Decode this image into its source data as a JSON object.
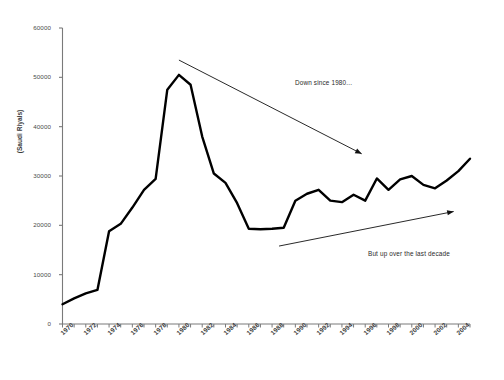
{
  "chart_data": {
    "type": "line",
    "title": "",
    "xlabel": "",
    "ylabel": "(Saudi Riyals)",
    "ylim": [
      0,
      60000
    ],
    "xlim": [
      1970,
      2005
    ],
    "grid": false,
    "legend": false,
    "y_ticks": [
      "0",
      "10000",
      "20000",
      "30000",
      "40000",
      "50000",
      "60000"
    ],
    "y_tick_values": [
      0,
      10000,
      20000,
      30000,
      40000,
      50000,
      60000
    ],
    "x_ticks": [
      "1970",
      "1972",
      "1974",
      "1976",
      "1978",
      "1980",
      "1982",
      "1984",
      "1986",
      "1988",
      "1990",
      "1992",
      "1994",
      "1996",
      "1998",
      "2000",
      "2002",
      "2004"
    ],
    "x_tick_values": [
      1970,
      1972,
      1974,
      1976,
      1978,
      1980,
      1982,
      1984,
      1986,
      1988,
      1990,
      1992,
      1994,
      1996,
      1998,
      2000,
      2002,
      2004
    ],
    "series": [
      {
        "name": "Saudi Riyals",
        "color": "#000000",
        "x": [
          1970,
          1971,
          1972,
          1973,
          1974,
          1975,
          1976,
          1977,
          1978,
          1979,
          1980,
          1981,
          1982,
          1983,
          1984,
          1985,
          1986,
          1987,
          1988,
          1989,
          1990,
          1991,
          1992,
          1993,
          1994,
          1995,
          1996,
          1997,
          1998,
          1999,
          2000,
          2001,
          2002,
          2003,
          2004,
          2005
        ],
        "values": [
          4000,
          5200,
          6200,
          6900,
          18800,
          20300,
          23600,
          27200,
          29400,
          47500,
          50500,
          48500,
          38000,
          30500,
          28600,
          24500,
          19300,
          19200,
          19300,
          19500,
          25000,
          26400,
          27200,
          25000,
          24700,
          26200,
          25000,
          29500,
          27200,
          29300,
          30000,
          28200,
          27500,
          29100,
          31000,
          33500
        ]
      }
    ],
    "annotations": [
      {
        "id": "down-since-1980",
        "text": "Down since 1980...",
        "arrow": {
          "x1": 1980.0,
          "y1": 53500,
          "x2": 1995.7,
          "y2": 34500
        }
      },
      {
        "id": "but-up-last-decade",
        "text": "But up over the last decade",
        "arrow": {
          "x1": 1988.6,
          "y1": 15800,
          "x2": 2003.6,
          "y2": 22800
        }
      }
    ],
    "axis_color": "#7a7a7a",
    "line_color": "#000000",
    "line_width": 2.4,
    "background": "#ffffff"
  }
}
